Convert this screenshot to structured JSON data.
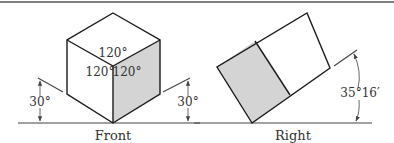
{
  "figure": {
    "type": "isometric projection diagram",
    "colors": {
      "line": "#1a1a1a",
      "shaded_face": "#d4d4d4",
      "top_rule": "#555555",
      "text": "#333333"
    }
  },
  "front_view": {
    "caption": "Front",
    "face_angles": {
      "top": "120°",
      "left": "120°",
      "right": "120°"
    },
    "tilt_left": "30°",
    "tilt_right": "30°",
    "shaded_face": "right"
  },
  "right_view": {
    "caption": "Right",
    "tilt_angle": "35°16′",
    "shaded_face": "left"
  }
}
